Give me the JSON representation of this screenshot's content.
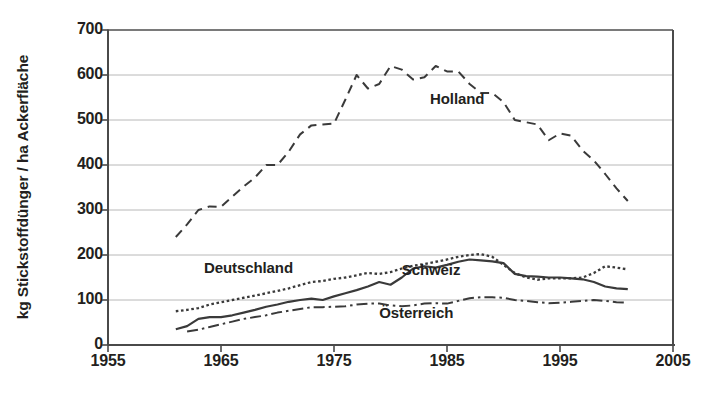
{
  "chart_data": {
    "type": "line",
    "title": "",
    "xlabel": "",
    "ylabel": "kg Stickstoffdünger / ha Ackerfläche",
    "xlim": [
      1955,
      2005
    ],
    "ylim": [
      0,
      700
    ],
    "xticks": [
      1955,
      1965,
      1975,
      1985,
      1995,
      2005
    ],
    "yticks": [
      0,
      100,
      200,
      300,
      400,
      500,
      600,
      700
    ],
    "grid": true,
    "legend_position": "inline-annotations",
    "series": [
      {
        "name": "Holland",
        "style": "long-dashed",
        "color": "#3a3a3a",
        "label_x": 1983.5,
        "label_y": 545,
        "x": [
          1961,
          1962,
          1963,
          1964,
          1965,
          1966,
          1967,
          1968,
          1969,
          1970,
          1971,
          1972,
          1973,
          1974,
          1975,
          1976,
          1977,
          1978,
          1979,
          1980,
          1981,
          1982,
          1983,
          1984,
          1985,
          1986,
          1987,
          1988,
          1989,
          1990,
          1991,
          1992,
          1993,
          1994,
          1995,
          1996,
          1997,
          1998,
          1999,
          2000,
          2001
        ],
        "values": [
          240,
          268,
          300,
          308,
          307,
          330,
          352,
          372,
          400,
          400,
          430,
          468,
          488,
          490,
          492,
          545,
          600,
          570,
          580,
          620,
          612,
          590,
          595,
          620,
          608,
          608,
          580,
          560,
          560,
          540,
          500,
          495,
          490,
          455,
          470,
          465,
          432,
          410,
          380,
          348,
          320
        ]
      },
      {
        "name": "Deutschland",
        "style": "dotted",
        "color": "#3a3a3a",
        "label_x": 1963.5,
        "label_y": 168,
        "x": [
          1961,
          1962,
          1963,
          1964,
          1965,
          1966,
          1967,
          1968,
          1969,
          1970,
          1971,
          1972,
          1973,
          1974,
          1975,
          1976,
          1977,
          1978,
          1979,
          1980,
          1981,
          1982,
          1983,
          1984,
          1985,
          1986,
          1987,
          1988,
          1989,
          1990,
          1991,
          1992,
          1993,
          1994,
          1995,
          1996,
          1997,
          1998,
          1999,
          2000,
          2001
        ],
        "values": [
          75,
          78,
          82,
          90,
          95,
          100,
          105,
          110,
          115,
          120,
          126,
          133,
          140,
          142,
          147,
          150,
          155,
          160,
          158,
          162,
          170,
          176,
          180,
          185,
          190,
          196,
          200,
          202,
          196,
          178,
          160,
          150,
          145,
          148,
          148,
          148,
          150,
          160,
          175,
          172,
          168
        ]
      },
      {
        "name": "Schweiz",
        "style": "solid",
        "color": "#3a3a3a",
        "label_x": 1981,
        "label_y": 165,
        "x": [
          1961,
          1962,
          1963,
          1964,
          1965,
          1966,
          1967,
          1968,
          1969,
          1970,
          1971,
          1972,
          1973,
          1974,
          1975,
          1976,
          1977,
          1978,
          1979,
          1980,
          1981,
          1982,
          1983,
          1984,
          1985,
          1986,
          1987,
          1988,
          1989,
          1990,
          1991,
          1992,
          1993,
          1994,
          1995,
          1996,
          1997,
          1998,
          1999,
          2000,
          2001
        ],
        "values": [
          35,
          42,
          58,
          62,
          62,
          66,
          72,
          78,
          85,
          90,
          96,
          100,
          103,
          100,
          108,
          115,
          122,
          130,
          140,
          134,
          150,
          170,
          175,
          172,
          178,
          185,
          190,
          188,
          186,
          182,
          158,
          153,
          152,
          150,
          150,
          148,
          146,
          140,
          130,
          126,
          124
        ]
      },
      {
        "name": "Österreich",
        "style": "dash-dot",
        "color": "#3a3a3a",
        "label_x": 1979,
        "label_y": 68,
        "x": [
          1962,
          1963,
          1964,
          1965,
          1966,
          1967,
          1968,
          1969,
          1970,
          1971,
          1972,
          1973,
          1974,
          1975,
          1976,
          1977,
          1978,
          1979,
          1980,
          1981,
          1982,
          1983,
          1984,
          1985,
          1986,
          1987,
          1988,
          1989,
          1990,
          1991,
          1992,
          1993,
          1994,
          1995,
          1996,
          1997,
          1998,
          1999,
          2000,
          2001
        ],
        "values": [
          30,
          34,
          40,
          46,
          52,
          58,
          62,
          66,
          72,
          76,
          80,
          84,
          84,
          85,
          86,
          90,
          92,
          92,
          88,
          86,
          88,
          92,
          93,
          92,
          98,
          104,
          106,
          106,
          105,
          100,
          98,
          95,
          93,
          94,
          96,
          98,
          100,
          98,
          95,
          94
        ]
      }
    ]
  },
  "axis": {
    "y_title": "kg Stickstoffdünger / ha Ackerfläche",
    "x_tick_labels": [
      "1955",
      "1965",
      "1975",
      "1985",
      "1995",
      "2005"
    ],
    "y_tick_labels": [
      "0",
      "100",
      "200",
      "300",
      "400",
      "500",
      "600",
      "700"
    ]
  },
  "annotations": {
    "holland": "Holland",
    "deutschland": "Deutschland",
    "schweiz": "Schweiz",
    "oesterreich": "Österreich"
  },
  "colors": {
    "ink": "#231f20",
    "line": "#3a3a3a",
    "grid": "#b8b8b8",
    "axis": "#4a4a4a",
    "background": "#ffffff"
  }
}
